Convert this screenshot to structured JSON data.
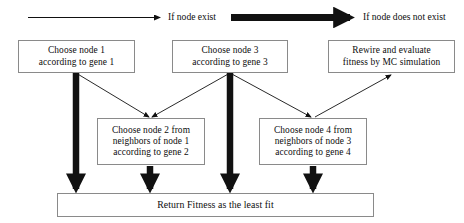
{
  "diagram": {
    "type": "flowchart",
    "legend": [
      {
        "id": "thin-arrow",
        "icon": "thin-arrow-icon",
        "label": "If node exist"
      },
      {
        "id": "thick-arrow",
        "icon": "thick-arrow-icon",
        "label": "If node does not exist"
      }
    ],
    "nodes": [
      {
        "id": "node1",
        "text": "Choose node 1\naccording to gene 1"
      },
      {
        "id": "node3",
        "text": "Choose node 3\naccording to gene 3"
      },
      {
        "id": "rewire",
        "text": "Rewire and evaluate\nfitness by MC simulation"
      },
      {
        "id": "node2",
        "text": "Choose node 2 from\nneighbors of node 1\naccording to gene 2"
      },
      {
        "id": "node4",
        "text": "Choose node 4 from\nneighbors of node 3\naccording to gene 4"
      },
      {
        "id": "return",
        "text": "Return Fitness as the least fit"
      }
    ],
    "edges": [
      {
        "from": "node1",
        "to": "node2",
        "style": "thin",
        "meaning": "If node exist"
      },
      {
        "from": "node3",
        "to": "node2",
        "style": "thin",
        "meaning": "If node exist"
      },
      {
        "from": "node3",
        "to": "node4",
        "style": "thin",
        "meaning": "If node exist"
      },
      {
        "from": "rewire",
        "to": "node4",
        "style": "thin",
        "meaning": "If node exist"
      },
      {
        "from": "node1",
        "to": "return",
        "style": "thick",
        "meaning": "If node does not exist"
      },
      {
        "from": "node3",
        "to": "return",
        "style": "thick",
        "meaning": "If node does not exist"
      },
      {
        "from": "node2",
        "to": "return",
        "style": "thick",
        "meaning": "If node does not exist"
      },
      {
        "from": "node4",
        "to": "return",
        "style": "thick",
        "meaning": "If node does not exist"
      }
    ],
    "colors": {
      "stroke": "#111111",
      "box_border": "#8a8a8a",
      "background": "#ffffff",
      "text": "#0d0d0d"
    }
  }
}
